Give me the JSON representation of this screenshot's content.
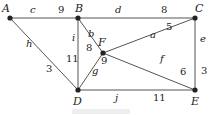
{
  "graph": {
    "nodes": [
      {
        "id": "A",
        "x": 10,
        "y": 18,
        "lx": 2,
        "ly": 12
      },
      {
        "id": "B",
        "x": 78,
        "y": 18,
        "lx": 75,
        "ly": 12
      },
      {
        "id": "C",
        "x": 195,
        "y": 18,
        "lx": 195,
        "ly": 12
      },
      {
        "id": "F",
        "x": 103,
        "y": 53,
        "lx": 98,
        "ly": 46
      },
      {
        "id": "D",
        "x": 78,
        "y": 90,
        "lx": 73,
        "ly": 105
      },
      {
        "id": "E",
        "x": 195,
        "y": 90,
        "lx": 191,
        "ly": 105
      }
    ],
    "edges": [
      {
        "id": "c",
        "from": "A",
        "to": "B",
        "weight": "9",
        "lx": 30,
        "ly": 13,
        "wx": 58,
        "wy": 13
      },
      {
        "id": "d",
        "from": "B",
        "to": "C",
        "weight": "8",
        "lx": 115,
        "ly": 13,
        "wx": 161,
        "wy": 13
      },
      {
        "id": "h",
        "from": "A",
        "to": "D",
        "weight": "3",
        "lx": 26,
        "ly": 47,
        "wx": 46,
        "wy": 72
      },
      {
        "id": "i",
        "from": "B",
        "to": "D",
        "weight": "11",
        "lx": 72,
        "ly": 41,
        "wx": 66,
        "wy": 62
      },
      {
        "id": "b",
        "from": "B",
        "to": "F",
        "weight": "8",
        "lx": 88,
        "ly": 37,
        "wx": 86,
        "wy": 51
      },
      {
        "id": "a",
        "from": "F",
        "to": "C",
        "weight": "5",
        "lx": 150,
        "ly": 38,
        "wx": 166,
        "wy": 30
      },
      {
        "id": "g",
        "from": "D",
        "to": "F",
        "weight": "9",
        "lx": 92,
        "ly": 74,
        "wx": 101,
        "wy": 64
      },
      {
        "id": "f",
        "from": "F",
        "to": "E",
        "weight": "6",
        "lx": 160,
        "ly": 62,
        "wx": 180,
        "wy": 75
      },
      {
        "id": "e",
        "from": "C",
        "to": "E",
        "weight": "3",
        "lx": 200,
        "ly": 42,
        "wx": 201,
        "wy": 74
      },
      {
        "id": "j",
        "from": "D",
        "to": "E",
        "weight": "11",
        "lx": 115,
        "ly": 101,
        "wx": 153,
        "wy": 101
      }
    ]
  },
  "caption": ""
}
